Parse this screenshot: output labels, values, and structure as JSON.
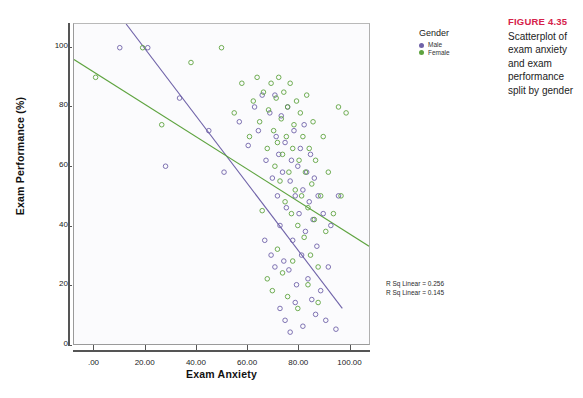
{
  "caption": {
    "title": "FIGURE 4.35",
    "body": "Scatterplot of exam anxiety and exam performance split by gender"
  },
  "legend": {
    "title": "Gender",
    "items": [
      {
        "label": "Male",
        "color": "#6f62a8"
      },
      {
        "label": "Female",
        "color": "#5ea33f"
      }
    ]
  },
  "annotations": {
    "rsq_male": "R Sq Linear = 0.256",
    "rsq_female": "R Sq Linear = 0.145"
  },
  "chart_data": {
    "type": "scatter",
    "title": "",
    "xlabel": "Exam Anxiety",
    "ylabel": "Exam Performance (%)",
    "xlim": [
      -8,
      108
    ],
    "ylim": [
      0,
      108
    ],
    "xticks": [
      0,
      20,
      40,
      60,
      80,
      100
    ],
    "xticklabels": [
      ".00",
      "20.00",
      "40.00",
      "60.00",
      "80.00",
      "100.00"
    ],
    "yticks": [
      0,
      20,
      40,
      60,
      80,
      100
    ],
    "yticklabels": [
      "0",
      "20",
      "40",
      "60",
      "80",
      "100"
    ],
    "grid": false,
    "legend_position": "right",
    "marker": "open-circle",
    "series": [
      {
        "name": "Male",
        "color": "#6f62a8",
        "fit_line": {
          "x": [
            12.5,
            97.5
          ],
          "y": [
            108,
            12
          ],
          "r_sq_linear": 0.256
        },
        "points": [
          [
            10.0,
            100.0
          ],
          [
            21.0,
            100.0
          ],
          [
            33.5,
            83.0
          ],
          [
            28.0,
            60.0
          ],
          [
            45.0,
            72.0
          ],
          [
            51.0,
            58.0
          ],
          [
            57.0,
            75.0
          ],
          [
            60.5,
            67.0
          ],
          [
            63.0,
            80.0
          ],
          [
            64.5,
            72.0
          ],
          [
            66.0,
            84.0
          ],
          [
            67.5,
            62.0
          ],
          [
            69.0,
            78.0
          ],
          [
            70.0,
            56.0
          ],
          [
            71.0,
            84.0
          ],
          [
            71.5,
            70.0
          ],
          [
            72.0,
            50.0
          ],
          [
            72.5,
            64.0
          ],
          [
            73.0,
            40.0
          ],
          [
            73.5,
            77.0
          ],
          [
            74.0,
            58.0
          ],
          [
            74.5,
            28.0
          ],
          [
            75.0,
            68.0
          ],
          [
            75.5,
            46.0
          ],
          [
            76.0,
            80.0
          ],
          [
            76.5,
            25.0
          ],
          [
            77.0,
            55.0
          ],
          [
            77.5,
            62.0
          ],
          [
            78.0,
            35.0
          ],
          [
            78.5,
            72.0
          ],
          [
            79.0,
            50.0
          ],
          [
            79.5,
            20.0
          ],
          [
            80.0,
            60.0
          ],
          [
            80.5,
            44.0
          ],
          [
            81.0,
            66.0
          ],
          [
            81.5,
            30.0
          ],
          [
            82.0,
            52.0
          ],
          [
            82.5,
            74.0
          ],
          [
            83.0,
            38.0
          ],
          [
            83.5,
            58.0
          ],
          [
            84.0,
            22.0
          ],
          [
            84.5,
            48.0
          ],
          [
            85.0,
            64.0
          ],
          [
            85.5,
            15.0
          ],
          [
            86.0,
            42.0
          ],
          [
            86.5,
            56.0
          ],
          [
            87.0,
            10.0
          ],
          [
            87.5,
            33.0
          ],
          [
            88.0,
            50.0
          ],
          [
            89.0,
            18.0
          ],
          [
            90.0,
            44.0
          ],
          [
            91.0,
            8.0
          ],
          [
            92.0,
            26.0
          ],
          [
            93.0,
            40.0
          ],
          [
            95.0,
            5.0
          ],
          [
            96.0,
            50.0
          ],
          [
            67.0,
            35.0
          ],
          [
            69.5,
            30.0
          ],
          [
            71.0,
            26.0
          ],
          [
            73.0,
            12.0
          ],
          [
            75.0,
            8.0
          ],
          [
            77.0,
            4.0
          ],
          [
            79.0,
            14.0
          ],
          [
            82.0,
            6.0
          ]
        ]
      },
      {
        "name": "Female",
        "color": "#5ea33f",
        "fit_line": {
          "x": [
            -8,
            108
          ],
          "y": [
            96,
            33
          ],
          "r_sq_linear": 0.145
        },
        "points": [
          [
            0.5,
            90.0
          ],
          [
            19.0,
            100.0
          ],
          [
            26.5,
            74.0
          ],
          [
            38.0,
            95.0
          ],
          [
            50.0,
            100.0
          ],
          [
            55.0,
            78.0
          ],
          [
            58.0,
            88.0
          ],
          [
            61.0,
            70.0
          ],
          [
            62.5,
            82.0
          ],
          [
            64.0,
            90.0
          ],
          [
            65.0,
            75.0
          ],
          [
            66.5,
            85.0
          ],
          [
            68.0,
            66.0
          ],
          [
            68.5,
            79.0
          ],
          [
            69.5,
            88.0
          ],
          [
            70.5,
            72.0
          ],
          [
            71.0,
            60.0
          ],
          [
            71.5,
            83.0
          ],
          [
            72.0,
            68.0
          ],
          [
            72.5,
            90.0
          ],
          [
            73.0,
            55.0
          ],
          [
            73.5,
            76.0
          ],
          [
            74.0,
            64.0
          ],
          [
            74.5,
            85.0
          ],
          [
            75.0,
            48.0
          ],
          [
            75.5,
            70.0
          ],
          [
            76.0,
            80.0
          ],
          [
            76.5,
            58.0
          ],
          [
            77.0,
            88.0
          ],
          [
            77.5,
            44.0
          ],
          [
            78.0,
            66.0
          ],
          [
            78.5,
            74.0
          ],
          [
            79.0,
            52.0
          ],
          [
            79.5,
            82.0
          ],
          [
            80.0,
            40.0
          ],
          [
            80.5,
            62.0
          ],
          [
            81.0,
            78.0
          ],
          [
            81.5,
            50.0
          ],
          [
            82.0,
            70.0
          ],
          [
            82.5,
            36.0
          ],
          [
            83.0,
            58.0
          ],
          [
            83.5,
            84.0
          ],
          [
            84.0,
            46.0
          ],
          [
            84.5,
            66.0
          ],
          [
            85.0,
            30.0
          ],
          [
            85.5,
            54.0
          ],
          [
            86.0,
            75.0
          ],
          [
            86.5,
            42.0
          ],
          [
            87.0,
            62.0
          ],
          [
            88.0,
            26.0
          ],
          [
            89.0,
            50.0
          ],
          [
            90.0,
            70.0
          ],
          [
            91.0,
            38.0
          ],
          [
            92.0,
            58.0
          ],
          [
            94.0,
            44.0
          ],
          [
            96.0,
            80.0
          ],
          [
            97.0,
            50.0
          ],
          [
            99.0,
            78.0
          ],
          [
            66.0,
            45.0
          ],
          [
            68.0,
            22.0
          ],
          [
            70.0,
            18.0
          ],
          [
            72.0,
            32.0
          ],
          [
            74.0,
            24.0
          ],
          [
            76.0,
            16.0
          ],
          [
            78.0,
            28.0
          ],
          [
            80.0,
            12.0
          ],
          [
            84.0,
            20.0
          ],
          [
            88.0,
            14.0
          ]
        ]
      }
    ]
  }
}
